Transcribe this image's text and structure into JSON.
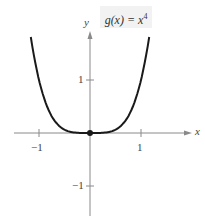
{
  "chart_data": {
    "type": "line",
    "function": "x^4",
    "xlabel": "x",
    "ylabel": "y",
    "xlim": [
      -1.75,
      2.0
    ],
    "ylim": [
      -1.55,
      1.95
    ],
    "x_ticks": [
      -1,
      1
    ],
    "x_tick_labels": [
      "−1",
      "1"
    ],
    "y_ticks": [
      -1,
      1
    ],
    "y_tick_labels": [
      "−1",
      "1"
    ],
    "grid": false,
    "legend": "none",
    "annotations": [
      {
        "type": "point",
        "x": 0,
        "y": 0,
        "filled": true
      }
    ],
    "series": [
      {
        "name": "g(x) = x^4",
        "x": [
          -1.16,
          -1.1,
          -1.0,
          -0.9,
          -0.8,
          -0.7,
          -0.6,
          -0.5,
          -0.4,
          -0.3,
          -0.2,
          -0.1,
          0,
          0.1,
          0.2,
          0.3,
          0.4,
          0.5,
          0.6,
          0.7,
          0.8,
          0.9,
          1.0,
          1.1,
          1.16
        ],
        "values": [
          1.81,
          1.46,
          1.0,
          0.656,
          0.41,
          0.24,
          0.13,
          0.0625,
          0.0256,
          0.0081,
          0.0016,
          0.0001,
          0,
          0.0001,
          0.0016,
          0.0081,
          0.0256,
          0.0625,
          0.13,
          0.24,
          0.41,
          0.656,
          1.0,
          1.46,
          1.81
        ]
      }
    ]
  },
  "labels": {
    "func_name": "g(x) = x",
    "exponent": "4",
    "x_axis": "x",
    "y_axis": "y",
    "x_tick_neg1": "−1",
    "x_tick_pos1": "1",
    "y_tick_pos1": "1",
    "y_tick_neg1": "−1"
  },
  "colors": {
    "curve": "#1a1a1a",
    "axis": "#8a8a8a",
    "label_bg": "#f2f2f2"
  }
}
